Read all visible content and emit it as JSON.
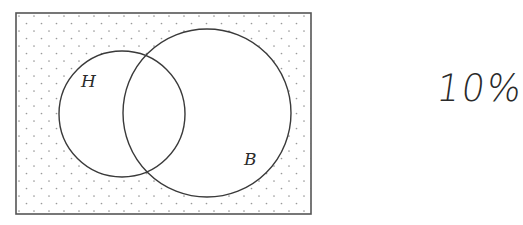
{
  "diagram": {
    "type": "venn",
    "universe": {
      "x": 16,
      "y": 13,
      "width": 295,
      "height": 201,
      "shading": "dotted",
      "stroke_color": "#555555",
      "dot_color": "#9a9a9a"
    },
    "sets": [
      {
        "label": "H",
        "cx": 122,
        "cy": 114,
        "r": 63,
        "label_x": 81,
        "label_y": 87
      },
      {
        "label": "B",
        "cx": 207,
        "cy": 113,
        "r": 84,
        "label_x": 244,
        "label_y": 165
      }
    ],
    "shaded_region": "outside H and B (complement of H ∪ B)",
    "stroke_color": "#3a3a3a"
  },
  "annotation": {
    "text": "10%",
    "style": "handwritten"
  }
}
